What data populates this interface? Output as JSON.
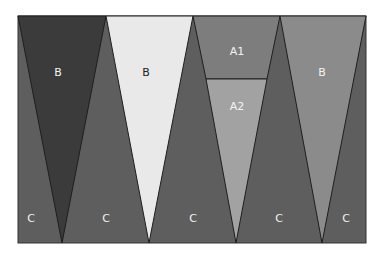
{
  "diagram": {
    "frame": {
      "x": 18,
      "y": 16,
      "width": 348,
      "height": 227,
      "fill": "#5e5e5e",
      "stroke": "#333333"
    },
    "regions": [
      {
        "id": "B-dark",
        "label": "B",
        "fill": "#3b3b3b",
        "points": "18,16 106,16 62,243",
        "label_x": 58,
        "label_y": 76
      },
      {
        "id": "B-light",
        "label": "B",
        "fill": "#e9e9e9",
        "points": "106,16 193,16 149,243",
        "label_x": 146,
        "label_y": 76,
        "label_color": "#222222"
      },
      {
        "id": "A1",
        "label": "A1",
        "fill": "#7d7d7d",
        "points": "193,16 280,16 267,79 206,79",
        "label_x": 237,
        "label_y": 55
      },
      {
        "id": "A2",
        "label": "A2",
        "fill": "#a2a2a2",
        "points": "206,79 267,79 236,243",
        "label_x": 237,
        "label_y": 110
      },
      {
        "id": "B-mid",
        "label": "B",
        "fill": "#8b8b8b",
        "points": "280,16 366,16 322,243",
        "label_x": 322,
        "label_y": 76
      }
    ],
    "c_labels": [
      {
        "label": "C",
        "x": 31,
        "y": 222
      },
      {
        "label": "C",
        "x": 106,
        "y": 222
      },
      {
        "label": "C",
        "x": 193,
        "y": 222
      },
      {
        "label": "C",
        "x": 279,
        "y": 222
      },
      {
        "label": "C",
        "x": 346,
        "y": 222
      }
    ]
  }
}
